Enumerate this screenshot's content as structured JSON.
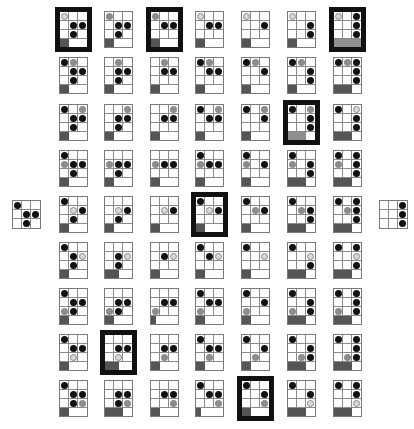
{
  "colors": {
    "black_piece": "#111111",
    "gray_piece": "#8c8c8c",
    "ring_piece": "#d8d8d8",
    "progress": "#555555",
    "highlight_border": "#111111"
  },
  "legend": {
    "b": "black-piece",
    "g": "gray-piece",
    "o": "ring-piece",
    "_": "empty"
  },
  "start_board": {
    "cells": [
      "b",
      "_",
      "_",
      "_",
      "b",
      "b",
      "_",
      "b",
      "_"
    ]
  },
  "goal_board": {
    "cells": [
      "_",
      "_",
      "b",
      "_",
      "_",
      "b",
      "_",
      "_",
      "b"
    ]
  },
  "rows": [
    [
      {
        "cells": [
          "o",
          "_",
          "_",
          "_",
          "b",
          "b",
          "_",
          "b",
          "_"
        ],
        "progress": 33,
        "highlight": true
      },
      {
        "cells": [
          "g",
          "_",
          "_",
          "_",
          "b",
          "b",
          "_",
          "b",
          "_"
        ],
        "progress": 33,
        "highlight": false
      },
      {
        "cells": [
          "g",
          "_",
          "_",
          "_",
          "b",
          "b",
          "_",
          "_",
          "_"
        ],
        "progress": 33,
        "highlight": true
      },
      {
        "cells": [
          "o",
          "_",
          "_",
          "_",
          "b",
          "b",
          "_",
          "_",
          "_"
        ],
        "progress": 33,
        "highlight": false
      },
      {
        "cells": [
          "o",
          "_",
          "_",
          "_",
          "_",
          "b",
          "_",
          "_",
          "_"
        ],
        "progress": 33,
        "highlight": false
      },
      {
        "cells": [
          "o",
          "_",
          "_",
          "_",
          "_",
          "b",
          "_",
          "_",
          "b"
        ],
        "progress": 33,
        "highlight": false
      },
      {
        "cells": [
          "o",
          "_",
          "b",
          "_",
          "_",
          "b",
          "_",
          "_",
          "b"
        ],
        "progress": 100,
        "highlight": true,
        "light": true
      }
    ],
    [
      {
        "cells": [
          "b",
          "g",
          "_",
          "_",
          "b",
          "b",
          "_",
          "b",
          "_"
        ],
        "progress": 33,
        "highlight": false
      },
      {
        "cells": [
          "_",
          "g",
          "_",
          "_",
          "b",
          "b",
          "_",
          "b",
          "_"
        ],
        "progress": 33,
        "highlight": false
      },
      {
        "cells": [
          "_",
          "g",
          "_",
          "_",
          "b",
          "b",
          "_",
          "_",
          "_"
        ],
        "progress": 33,
        "highlight": false
      },
      {
        "cells": [
          "b",
          "g",
          "_",
          "_",
          "b",
          "b",
          "_",
          "_",
          "_"
        ],
        "progress": 33,
        "highlight": false
      },
      {
        "cells": [
          "b",
          "g",
          "_",
          "_",
          "_",
          "b",
          "_",
          "_",
          "_"
        ],
        "progress": 33,
        "highlight": false
      },
      {
        "cells": [
          "b",
          "g",
          "_",
          "_",
          "_",
          "b",
          "_",
          "_",
          "b"
        ],
        "progress": 33,
        "highlight": false
      },
      {
        "cells": [
          "b",
          "g",
          "b",
          "_",
          "_",
          "b",
          "_",
          "_",
          "b"
        ],
        "progress": 66,
        "highlight": false
      }
    ],
    [
      {
        "cells": [
          "b",
          "_",
          "g",
          "_",
          "b",
          "b",
          "_",
          "b",
          "_"
        ],
        "progress": 33,
        "highlight": false
      },
      {
        "cells": [
          "_",
          "_",
          "g",
          "_",
          "b",
          "b",
          "_",
          "b",
          "_"
        ],
        "progress": 33,
        "highlight": false
      },
      {
        "cells": [
          "_",
          "_",
          "g",
          "_",
          "b",
          "b",
          "_",
          "_",
          "_"
        ],
        "progress": 33,
        "highlight": false
      },
      {
        "cells": [
          "b",
          "_",
          "g",
          "_",
          "b",
          "b",
          "_",
          "_",
          "_"
        ],
        "progress": 33,
        "highlight": false
      },
      {
        "cells": [
          "b",
          "_",
          "g",
          "_",
          "_",
          "b",
          "_",
          "_",
          "_"
        ],
        "progress": 33,
        "highlight": false
      },
      {
        "cells": [
          "b",
          "_",
          "g",
          "_",
          "_",
          "b",
          "_",
          "_",
          "b"
        ],
        "progress": 66,
        "highlight": true,
        "light": true
      },
      {
        "cells": [
          "b",
          "_",
          "o",
          "_",
          "_",
          "b",
          "_",
          "_",
          "b"
        ],
        "progress": 66,
        "highlight": false
      }
    ],
    [
      {
        "cells": [
          "b",
          "_",
          "_",
          "g",
          "b",
          "b",
          "_",
          "b",
          "_"
        ],
        "progress": 33,
        "highlight": false
      },
      {
        "cells": [
          "_",
          "_",
          "_",
          "g",
          "b",
          "b",
          "_",
          "b",
          "_"
        ],
        "progress": 33,
        "highlight": false
      },
      {
        "cells": [
          "_",
          "_",
          "_",
          "g",
          "b",
          "b",
          "_",
          "_",
          "_"
        ],
        "progress": 33,
        "highlight": false
      },
      {
        "cells": [
          "b",
          "_",
          "_",
          "g",
          "b",
          "b",
          "_",
          "_",
          "_"
        ],
        "progress": 33,
        "highlight": false
      },
      {
        "cells": [
          "b",
          "_",
          "_",
          "g",
          "_",
          "b",
          "_",
          "_",
          "_"
        ],
        "progress": 33,
        "highlight": false
      },
      {
        "cells": [
          "b",
          "_",
          "_",
          "g",
          "_",
          "b",
          "_",
          "_",
          "b"
        ],
        "progress": 66,
        "highlight": false
      },
      {
        "cells": [
          "b",
          "_",
          "b",
          "g",
          "_",
          "b",
          "_",
          "_",
          "b"
        ],
        "progress": 66,
        "highlight": false
      }
    ],
    [
      {
        "cells": [
          "b",
          "_",
          "_",
          "_",
          "o",
          "b",
          "_",
          "b",
          "_"
        ],
        "progress": 33,
        "highlight": false
      },
      {
        "cells": [
          "_",
          "_",
          "_",
          "_",
          "o",
          "b",
          "_",
          "b",
          "_"
        ],
        "progress": 33,
        "highlight": false
      },
      {
        "cells": [
          "_",
          "_",
          "_",
          "_",
          "o",
          "b",
          "_",
          "_",
          "_"
        ],
        "progress": 33,
        "highlight": false
      },
      {
        "cells": [
          "b",
          "_",
          "_",
          "_",
          "o",
          "b",
          "_",
          "_",
          "_"
        ],
        "progress": 33,
        "highlight": true
      },
      {
        "cells": [
          "b",
          "_",
          "_",
          "_",
          "g",
          "b",
          "_",
          "_",
          "_"
        ],
        "progress": 33,
        "highlight": false
      },
      {
        "cells": [
          "b",
          "_",
          "_",
          "_",
          "g",
          "b",
          "_",
          "_",
          "b"
        ],
        "progress": 66,
        "highlight": false
      },
      {
        "cells": [
          "b",
          "_",
          "b",
          "_",
          "g",
          "b",
          "_",
          "_",
          "b"
        ],
        "progress": 66,
        "highlight": false
      }
    ],
    [
      {
        "cells": [
          "b",
          "_",
          "_",
          "_",
          "b",
          "o",
          "_",
          "b",
          "_"
        ],
        "progress": 33,
        "highlight": false
      },
      {
        "cells": [
          "_",
          "_",
          "_",
          "_",
          "b",
          "o",
          "_",
          "b",
          "_"
        ],
        "progress": 50,
        "highlight": false
      },
      {
        "cells": [
          "_",
          "_",
          "_",
          "_",
          "b",
          "o",
          "_",
          "_",
          "_"
        ],
        "progress": 33,
        "highlight": false
      },
      {
        "cells": [
          "b",
          "_",
          "_",
          "_",
          "b",
          "o",
          "_",
          "_",
          "_"
        ],
        "progress": 33,
        "highlight": false
      },
      {
        "cells": [
          "b",
          "_",
          "_",
          "_",
          "_",
          "o",
          "_",
          "_",
          "_"
        ],
        "progress": 33,
        "highlight": false
      },
      {
        "cells": [
          "b",
          "_",
          "_",
          "_",
          "_",
          "o",
          "_",
          "_",
          "b"
        ],
        "progress": 66,
        "highlight": false
      },
      {
        "cells": [
          "b",
          "_",
          "b",
          "_",
          "_",
          "o",
          "_",
          "_",
          "b"
        ],
        "progress": 66,
        "highlight": false
      }
    ],
    [
      {
        "cells": [
          "b",
          "_",
          "_",
          "_",
          "b",
          "b",
          "g",
          "b",
          "_"
        ],
        "progress": 33,
        "highlight": false
      },
      {
        "cells": [
          "_",
          "_",
          "_",
          "_",
          "b",
          "b",
          "g",
          "b",
          "_"
        ],
        "progress": 33,
        "highlight": false
      },
      {
        "cells": [
          "_",
          "_",
          "_",
          "_",
          "b",
          "b",
          "g",
          "_",
          "_"
        ],
        "progress": 20,
        "highlight": false
      },
      {
        "cells": [
          "b",
          "_",
          "_",
          "_",
          "b",
          "b",
          "g",
          "_",
          "_"
        ],
        "progress": 33,
        "highlight": false
      },
      {
        "cells": [
          "b",
          "_",
          "_",
          "_",
          "_",
          "b",
          "g",
          "_",
          "_"
        ],
        "progress": 33,
        "highlight": false
      },
      {
        "cells": [
          "b",
          "_",
          "_",
          "_",
          "_",
          "b",
          "g",
          "_",
          "b"
        ],
        "progress": 66,
        "highlight": false
      },
      {
        "cells": [
          "b",
          "_",
          "b",
          "_",
          "_",
          "b",
          "g",
          "_",
          "b"
        ],
        "progress": 66,
        "highlight": false
      }
    ],
    [
      {
        "cells": [
          "b",
          "_",
          "_",
          "_",
          "b",
          "b",
          "_",
          "o",
          "_"
        ],
        "progress": 33,
        "highlight": false
      },
      {
        "cells": [
          "_",
          "_",
          "_",
          "_",
          "b",
          "b",
          "_",
          "o",
          "_"
        ],
        "progress": 50,
        "highlight": true
      },
      {
        "cells": [
          "_",
          "_",
          "_",
          "_",
          "b",
          "b",
          "_",
          "g",
          "_"
        ],
        "progress": 33,
        "highlight": false
      },
      {
        "cells": [
          "b",
          "_",
          "_",
          "_",
          "b",
          "b",
          "_",
          "g",
          "_"
        ],
        "progress": 33,
        "highlight": false
      },
      {
        "cells": [
          "b",
          "_",
          "_",
          "_",
          "_",
          "b",
          "_",
          "g",
          "_"
        ],
        "progress": 33,
        "highlight": false
      },
      {
        "cells": [
          "b",
          "_",
          "_",
          "_",
          "_",
          "b",
          "_",
          "g",
          "b"
        ],
        "progress": 66,
        "highlight": false
      },
      {
        "cells": [
          "b",
          "_",
          "b",
          "_",
          "_",
          "b",
          "_",
          "g",
          "b"
        ],
        "progress": 66,
        "highlight": false
      }
    ],
    [
      {
        "cells": [
          "b",
          "_",
          "_",
          "_",
          "b",
          "b",
          "_",
          "b",
          "g"
        ],
        "progress": 33,
        "highlight": false
      },
      {
        "cells": [
          "_",
          "_",
          "_",
          "_",
          "b",
          "b",
          "_",
          "b",
          "g"
        ],
        "progress": 66,
        "highlight": false
      },
      {
        "cells": [
          "_",
          "_",
          "_",
          "_",
          "b",
          "b",
          "_",
          "_",
          "g"
        ],
        "progress": 33,
        "highlight": false
      },
      {
        "cells": [
          "b",
          "_",
          "_",
          "_",
          "b",
          "b",
          "_",
          "_",
          "g"
        ],
        "progress": 20,
        "highlight": false
      },
      {
        "cells": [
          "b",
          "_",
          "_",
          "_",
          "_",
          "b",
          "_",
          "_",
          "g"
        ],
        "progress": 33,
        "highlight": true
      },
      {
        "cells": [
          "b",
          "_",
          "_",
          "_",
          "_",
          "b",
          "_",
          "_",
          "o"
        ],
        "progress": 66,
        "highlight": false
      },
      {
        "cells": [
          "b",
          "_",
          "b",
          "_",
          "_",
          "b",
          "_",
          "_",
          "o"
        ],
        "progress": 66,
        "highlight": false
      }
    ]
  ],
  "layout": {
    "col_x": [
      59,
      104,
      150,
      195,
      241,
      287,
      333
    ],
    "row_y": [
      11,
      57,
      104,
      150,
      196,
      242,
      288,
      334,
      380
    ],
    "start_pos": [
      12,
      200
    ],
    "goal_pos": [
      379,
      200
    ]
  }
}
